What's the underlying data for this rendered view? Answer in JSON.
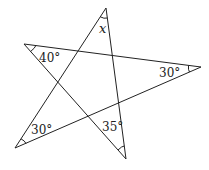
{
  "diagram": {
    "type": "star-polygon",
    "stroke_color": "#222222",
    "background": "#ffffff",
    "vertices": {
      "top": {
        "x": 106,
        "y": 8
      },
      "left": {
        "x": 24,
        "y": 44
      },
      "right": {
        "x": 201,
        "y": 67
      },
      "bottom_left": {
        "x": 15,
        "y": 148
      },
      "bottom": {
        "x": 126,
        "y": 159
      }
    },
    "angles": [
      {
        "vertex": "top",
        "label": "x"
      },
      {
        "vertex": "left",
        "label": "40°"
      },
      {
        "vertex": "right",
        "label": "30°"
      },
      {
        "vertex": "bottom_left",
        "label": "30°"
      },
      {
        "vertex": "bottom",
        "label": "35°"
      }
    ]
  }
}
